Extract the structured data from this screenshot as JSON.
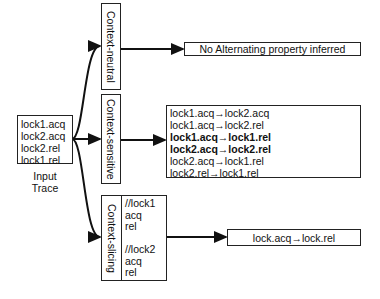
{
  "input": {
    "lines": [
      "lock1.acq",
      "lock2.acq",
      "lock2.rel",
      "lock1.rel"
    ],
    "caption_line1": "Input",
    "caption_line2": "Trace"
  },
  "analyses": {
    "neutral": {
      "label": "Context-neutral"
    },
    "sensitive": {
      "label": "Context-sensitive"
    },
    "slicing": {
      "label": "Context-slicing",
      "slices": [
        "//lock1",
        "acq",
        "rel",
        "",
        "//lock2",
        "acq",
        "rel"
      ]
    }
  },
  "results": {
    "neutral": "No Alternating property inferred",
    "sensitive": [
      {
        "text": "lock1.acq→lock2.acq",
        "bold": false
      },
      {
        "text": "lock1.acq→lock2.rel",
        "bold": false
      },
      {
        "text": "lock1.acq→lock1.rel",
        "bold": true
      },
      {
        "text": "lock2.acq→lock2.rel",
        "bold": true
      },
      {
        "text": "lock2.acq→lock1.rel",
        "bold": false
      },
      {
        "text": "lock2.rel→lock1.rel",
        "bold": false
      }
    ],
    "slicing": "lock.acq→lock.rel"
  }
}
